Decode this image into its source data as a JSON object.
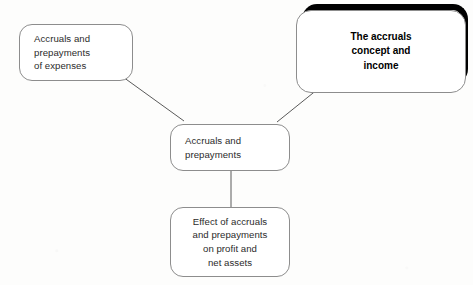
{
  "diagram": {
    "type": "mind-map",
    "title": "Accruals and prepayments",
    "background_color": "#fdfdfc",
    "nodes": [
      {
        "id": "expenses",
        "label": "Accruals and\nprepayments\nof expenses",
        "role": "branch",
        "position": "top-left",
        "emphasis": "normal",
        "text_align": "left",
        "border_color": "#8d8d8d",
        "text_color": "#2b2b2b"
      },
      {
        "id": "concept",
        "label": "The accruals\nconcept and\nincome",
        "role": "branch",
        "position": "top-right",
        "emphasis": "highlighted",
        "text_align": "center",
        "border_color": "#000000",
        "text_color": "#000000",
        "bold": true
      },
      {
        "id": "central",
        "label": "Accruals and\nprepayments",
        "role": "center",
        "position": "center",
        "emphasis": "normal",
        "text_align": "left",
        "border_color": "#8d8d8d",
        "text_color": "#2b2b2b"
      },
      {
        "id": "effect",
        "label": "Effect of accruals\nand prepayments\non profit and\nnet assets",
        "role": "branch",
        "position": "bottom",
        "emphasis": "normal",
        "text_align": "center",
        "border_color": "#8d8d8d",
        "text_color": "#2b2b2b"
      }
    ],
    "connectors": [
      {
        "id": "expenses-to-central",
        "from": "expenses",
        "to": "central",
        "style": "straight-diagonal",
        "color": "#5a5a5a"
      },
      {
        "id": "concept-to-central",
        "from": "concept",
        "to": "central",
        "style": "straight-diagonal",
        "color": "#5a5a5a"
      },
      {
        "id": "central-to-effect",
        "from": "central",
        "to": "effect",
        "style": "straight-vertical",
        "color": "#5a5a5a"
      }
    ]
  }
}
